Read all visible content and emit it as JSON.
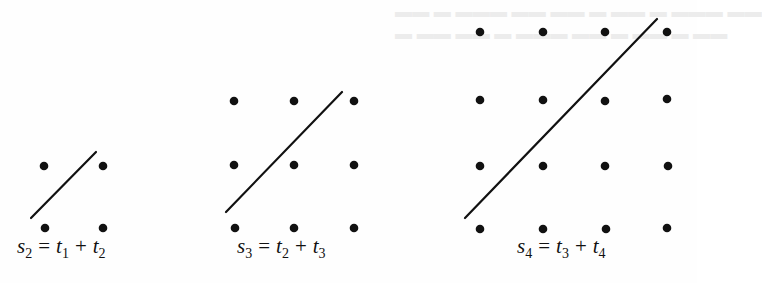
{
  "figure": {
    "diagrams": [
      {
        "id": "s2",
        "label": {
          "lhs": "s",
          "lhs_sub": "2",
          "eq": "=",
          "t_a": "t",
          "t_a_sub": "1",
          "plus": "+",
          "t_b": "t",
          "t_b_sub": "2"
        },
        "grid": {
          "rows": 2,
          "cols": 2
        },
        "dots": [
          [
            44,
            166
          ],
          [
            103,
            166
          ],
          [
            45,
            228
          ],
          [
            103,
            228
          ]
        ],
        "line": [
          31,
          218,
          96,
          152
        ]
      },
      {
        "id": "s3",
        "label": {
          "lhs": "s",
          "lhs_sub": "3",
          "eq": "=",
          "t_a": "t",
          "t_a_sub": "2",
          "plus": "+",
          "t_b": "t",
          "t_b_sub": "3"
        },
        "grid": {
          "rows": 3,
          "cols": 3
        },
        "dots": [
          [
            234,
            101
          ],
          [
            294,
            101
          ],
          [
            354,
            101
          ],
          [
            234,
            165
          ],
          [
            294,
            165
          ],
          [
            354,
            165
          ],
          [
            235,
            228
          ],
          [
            294,
            228
          ],
          [
            354,
            228
          ]
        ],
        "line": [
          226,
          212,
          342,
          92
        ]
      },
      {
        "id": "s4",
        "label": {
          "lhs": "s",
          "lhs_sub": "4",
          "eq": "=",
          "t_a": "t",
          "t_a_sub": "3",
          "plus": "+",
          "t_b": "t",
          "t_b_sub": "4"
        },
        "grid": {
          "rows": 4,
          "cols": 4
        },
        "dots": [
          [
            480,
            32
          ],
          [
            543,
            32
          ],
          [
            605,
            32
          ],
          [
            667,
            32
          ],
          [
            480,
            100
          ],
          [
            543,
            100
          ],
          [
            605,
            101
          ],
          [
            667,
            99
          ],
          [
            480,
            166
          ],
          [
            543,
            166
          ],
          [
            605,
            166
          ],
          [
            668,
            166
          ],
          [
            480,
            229
          ],
          [
            543,
            229
          ],
          [
            606,
            229
          ],
          [
            667,
            228
          ]
        ],
        "line": [
          465,
          218,
          657,
          19
        ]
      }
    ],
    "colors": {
      "ink": "#111111",
      "paper": "#fefefe"
    }
  }
}
